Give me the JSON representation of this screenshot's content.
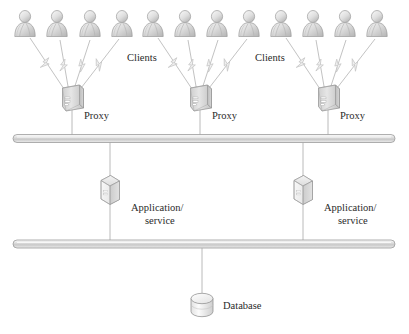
{
  "diagram": {
    "background_color": "#ffffff",
    "width": 409,
    "height": 334,
    "palette": {
      "icon_fill_light": "#f2f2f2",
      "icon_fill_mid": "#d8d8d8",
      "icon_fill_dark": "#b8b8b8",
      "icon_stroke": "#8f8f8f",
      "bus_stroke": "#9a9a9a",
      "connector_stroke": "#a8a8a8",
      "bolt_stroke": "#c8c8c8",
      "text_color": "#2a2a2a"
    },
    "labels": {
      "clients_left": "Clients",
      "clients_right": "Clients",
      "proxy_1": "Proxy",
      "proxy_2": "Proxy",
      "proxy_3": "Proxy",
      "app_left_line1": "Application/",
      "app_left_line2": "service",
      "app_right_line1": "Application/",
      "app_right_line2": "service",
      "database": "Database"
    },
    "icons": {
      "client": "user-person-icon",
      "proxy": "server-box-icon",
      "app": "service-cube-icon",
      "database": "database-cylinder-icon",
      "bus": "network-bus-bar",
      "link": "lightning-bolt-link"
    },
    "client_groups": [
      {
        "name": "group-1",
        "count": 4,
        "x_positions": [
          25,
          57,
          90,
          122
        ],
        "proxy_x": 72
      },
      {
        "name": "group-2",
        "count": 4,
        "x_positions": [
          153,
          185,
          217,
          249
        ],
        "proxy_x": 200
      },
      {
        "name": "group-3",
        "count": 4,
        "x_positions": [
          281,
          313,
          345,
          377
        ],
        "proxy_x": 328
      }
    ],
    "tiers": [
      {
        "name": "client-tier",
        "y": 30
      },
      {
        "name": "proxy-tier",
        "y": 95
      },
      {
        "name": "bus-upper",
        "y": 139
      },
      {
        "name": "application-tier",
        "y": 190
      },
      {
        "name": "bus-lower",
        "y": 244
      },
      {
        "name": "database-tier",
        "y": 305
      }
    ],
    "applications": [
      {
        "name": "app-left",
        "x": 110,
        "y": 190
      },
      {
        "name": "app-right",
        "x": 303,
        "y": 190
      }
    ],
    "database_node": {
      "name": "database",
      "x": 202,
      "y": 305
    }
  }
}
